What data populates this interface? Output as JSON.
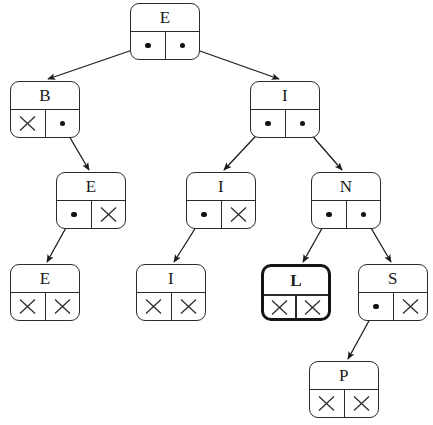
{
  "diagram": {
    "canvas": {
      "width": 433,
      "height": 425
    },
    "colors": {
      "stroke": "#2b2b2b",
      "highlight": "#141414",
      "background": "#ffffff",
      "dot": "#111111"
    },
    "null_symbol": "X",
    "nodes": [
      {
        "id": "root-e",
        "key": "E",
        "x": 130,
        "y": 3,
        "left": "pointer",
        "right": "pointer",
        "highlight": false,
        "level": 0
      },
      {
        "id": "b",
        "key": "B",
        "x": 10,
        "y": 81,
        "left": "null",
        "right": "pointer",
        "highlight": false,
        "level": 1
      },
      {
        "id": "i-right",
        "key": "I",
        "x": 250,
        "y": 81,
        "left": "pointer",
        "right": "pointer",
        "highlight": false,
        "level": 1
      },
      {
        "id": "e-mid",
        "key": "E",
        "x": 56,
        "y": 172,
        "left": "pointer",
        "right": "null",
        "highlight": false,
        "level": 2
      },
      {
        "id": "i-mid",
        "key": "I",
        "x": 186,
        "y": 172,
        "left": "pointer",
        "right": "null",
        "highlight": false,
        "level": 2
      },
      {
        "id": "n",
        "key": "N",
        "x": 311,
        "y": 172,
        "left": "pointer",
        "right": "pointer",
        "highlight": false,
        "level": 2
      },
      {
        "id": "e-leaf",
        "key": "E",
        "x": 10,
        "y": 264,
        "left": "null",
        "right": "null",
        "highlight": false,
        "level": 3
      },
      {
        "id": "i-leaf",
        "key": "I",
        "x": 136,
        "y": 264,
        "left": "null",
        "right": "null",
        "highlight": false,
        "level": 3
      },
      {
        "id": "l",
        "key": "L",
        "x": 261,
        "y": 264,
        "left": "null",
        "right": "null",
        "highlight": true,
        "level": 3
      },
      {
        "id": "s",
        "key": "S",
        "x": 358,
        "y": 264,
        "left": "pointer",
        "right": "null",
        "highlight": false,
        "level": 3
      },
      {
        "id": "p",
        "key": "P",
        "x": 309,
        "y": 361,
        "left": "null",
        "right": "null",
        "highlight": false,
        "level": 4
      }
    ],
    "edges": [
      {
        "from": "root-e",
        "from_side": "left",
        "to": "b",
        "x1": 147,
        "y1": 45,
        "x2": 48,
        "y2": 79
      },
      {
        "from": "root-e",
        "from_side": "right",
        "to": "i-right",
        "x1": 183,
        "y1": 45,
        "x2": 279,
        "y2": 79
      },
      {
        "from": "b",
        "from_side": "right",
        "to": "e-mid",
        "x1": 62,
        "y1": 124,
        "x2": 89,
        "y2": 170
      },
      {
        "from": "i-right",
        "from_side": "left",
        "to": "i-mid",
        "x1": 267,
        "y1": 124,
        "x2": 224,
        "y2": 170
      },
      {
        "from": "i-right",
        "from_side": "right",
        "to": "n",
        "x1": 302,
        "y1": 124,
        "x2": 342,
        "y2": 170
      },
      {
        "from": "e-mid",
        "from_side": "left",
        "to": "e-leaf",
        "x1": 73,
        "y1": 215,
        "x2": 47,
        "y2": 262
      },
      {
        "from": "i-mid",
        "from_side": "left",
        "to": "i-leaf",
        "x1": 203,
        "y1": 216,
        "x2": 174,
        "y2": 262
      },
      {
        "from": "n",
        "from_side": "left",
        "to": "l",
        "x1": 329,
        "y1": 216,
        "x2": 303,
        "y2": 262
      },
      {
        "from": "n",
        "from_side": "right",
        "to": "s",
        "x1": 364,
        "y1": 216,
        "x2": 391,
        "y2": 262
      },
      {
        "from": "s",
        "from_side": "left",
        "to": "p",
        "x1": 376,
        "y1": 308,
        "x2": 348,
        "y2": 359
      }
    ]
  }
}
